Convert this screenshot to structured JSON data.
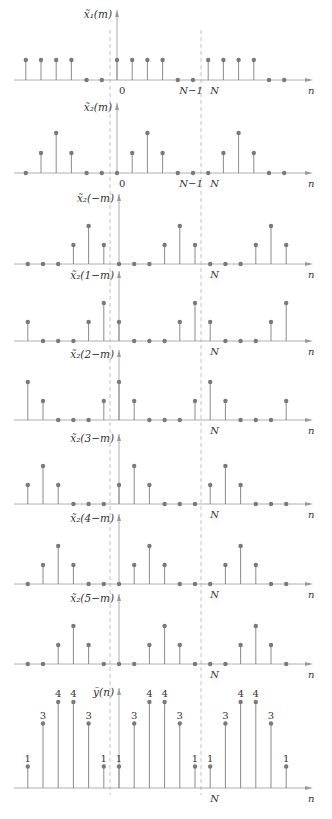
{
  "figure": {
    "caption": "",
    "period_N": 6,
    "x_spacing_px": 15.2,
    "origin_x_px": 117,
    "dashed_lines_x_px": [
      110,
      201
    ],
    "colors": {
      "stem": "#8a8a8a",
      "dot": "#7a7a7a",
      "axis": "#9a9a9a",
      "dashed": "#b5b5b5",
      "text": "#333333"
    }
  },
  "chart_data": [
    {
      "type": "stem",
      "id": "x1",
      "label": "x̃₁(m)",
      "axis_y_px": 80,
      "unit_px": 20,
      "n_range": [
        -6,
        11
      ],
      "period_values": [
        1,
        1,
        1,
        1,
        0,
        0
      ],
      "tick_labels": [
        {
          "n": 0,
          "text": "0"
        },
        {
          "n": 5,
          "text": "N−1"
        },
        {
          "n": 6,
          "text": "N"
        }
      ],
      "xlabel": "n"
    },
    {
      "type": "stem",
      "id": "x2",
      "label": "x̃₂(m)",
      "axis_y_px": 173,
      "unit_px": 20,
      "n_range": [
        -6,
        11
      ],
      "period_values": [
        0,
        1,
        2,
        1,
        0,
        0
      ],
      "tick_labels": [
        {
          "n": 0,
          "text": "0"
        },
        {
          "n": 5,
          "text": "N−1"
        },
        {
          "n": 6,
          "text": "N"
        }
      ],
      "xlabel": "n"
    },
    {
      "type": "stem",
      "id": "x2_neg",
      "label": "x̃₂(−m)",
      "axis_y_px": 264,
      "unit_px": 19,
      "shift": 0,
      "n_range": [
        -6,
        11
      ],
      "tick_labels": [
        {
          "n": 6,
          "text": "N"
        }
      ],
      "xlabel": "n"
    },
    {
      "type": "stem",
      "id": "x2_1m",
      "label": "x̃₂(1−m)",
      "axis_y_px": 341,
      "unit_px": 19,
      "shift": 1,
      "n_range": [
        -6,
        11
      ],
      "tick_labels": [
        {
          "n": 6,
          "text": "N"
        }
      ],
      "xlabel": "n"
    },
    {
      "type": "stem",
      "id": "x2_2m",
      "label": "x̃₂(2−m)",
      "axis_y_px": 420,
      "unit_px": 19,
      "shift": 2,
      "n_range": [
        -6,
        11
      ],
      "tick_labels": [
        {
          "n": 6,
          "text": "N"
        }
      ],
      "xlabel": "n"
    },
    {
      "type": "stem",
      "id": "x2_3m",
      "label": "x̃₂(3−m)",
      "axis_y_px": 504,
      "unit_px": 19,
      "shift": 3,
      "n_range": [
        -6,
        11
      ],
      "tick_labels": [
        {
          "n": 6,
          "text": "N"
        }
      ],
      "xlabel": "n"
    },
    {
      "type": "stem",
      "id": "x2_4m",
      "label": "x̃₂(4−m)",
      "axis_y_px": 584,
      "unit_px": 19,
      "shift": 4,
      "n_range": [
        -6,
        11
      ],
      "tick_labels": [
        {
          "n": 6,
          "text": "N"
        }
      ],
      "xlabel": "n"
    },
    {
      "type": "stem",
      "id": "x2_5m",
      "label": "x̃₂(5−m)",
      "axis_y_px": 664,
      "unit_px": 19,
      "shift": 5,
      "n_range": [
        -6,
        11
      ],
      "tick_labels": [
        {
          "n": 6,
          "text": "N"
        }
      ],
      "xlabel": "n"
    },
    {
      "type": "stem",
      "id": "y",
      "label": "ỹ(n)",
      "axis_y_px": 788,
      "unit_px": 21.5,
      "n_range": [
        -6,
        11
      ],
      "period_values": [
        1,
        3,
        4,
        4,
        3,
        1
      ],
      "show_value_labels": true,
      "tick_labels": [
        {
          "n": 6,
          "text": "N"
        }
      ],
      "xlabel": "n"
    }
  ]
}
